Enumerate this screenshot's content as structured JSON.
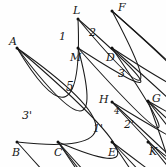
{
  "diagram": {
    "stroke_color": "#1a1a1a",
    "background_color": "#fefefe",
    "vertex_labels": [
      {
        "name": "A",
        "text": "A",
        "x": 9,
        "y": 36
      },
      {
        "name": "L",
        "text": "L",
        "x": 73,
        "y": 5
      },
      {
        "name": "F",
        "text": "F",
        "x": 118,
        "y": 2
      },
      {
        "name": "M",
        "text": "M",
        "x": 70,
        "y": 52
      },
      {
        "name": "D",
        "text": "D",
        "x": 106,
        "y": 52
      },
      {
        "name": "H",
        "text": "H",
        "x": 99,
        "y": 94
      },
      {
        "name": "G",
        "text": "G",
        "x": 152,
        "y": 93
      },
      {
        "name": "B",
        "text": "B",
        "x": 12,
        "y": 147
      },
      {
        "name": "C",
        "text": "C",
        "x": 54,
        "y": 147
      },
      {
        "name": "E",
        "text": "E",
        "x": 108,
        "y": 147
      },
      {
        "name": "K",
        "text": "K",
        "x": 149,
        "y": 146
      }
    ],
    "region_labels": [
      {
        "name": "region-1",
        "text": "1",
        "x": 59,
        "y": 31,
        "size": "region"
      },
      {
        "name": "region-2",
        "text": "2",
        "x": 89,
        "y": 27,
        "size": "region"
      },
      {
        "name": "region-3",
        "text": "3",
        "x": 118,
        "y": 68,
        "size": "region"
      },
      {
        "name": "region-5",
        "text": "5",
        "x": 66,
        "y": 81,
        "size": "region-big"
      },
      {
        "name": "region-3-prime",
        "text": "3'",
        "x": 22,
        "y": 110,
        "size": "region"
      },
      {
        "name": "region-4",
        "text": "4",
        "x": 114,
        "y": 107,
        "size": "small"
      },
      {
        "name": "region-1-prime",
        "text": "1'",
        "x": 93,
        "y": 123,
        "size": "region"
      },
      {
        "name": "region-2-prime",
        "text": "2'",
        "x": 124,
        "y": 119,
        "size": "region"
      }
    ],
    "points": {
      "A": {
        "x": 17,
        "y": 48
      },
      "L": {
        "x": 78,
        "y": 19
      },
      "F": {
        "x": 112,
        "y": 11
      },
      "M": {
        "x": 78,
        "y": 48
      },
      "D": {
        "x": 112,
        "y": 48
      },
      "H": {
        "x": 112,
        "y": 102
      },
      "G": {
        "x": 148,
        "y": 101
      },
      "B": {
        "x": 17,
        "y": 142
      },
      "C": {
        "x": 58,
        "y": 142
      },
      "E": {
        "x": 112,
        "y": 142
      },
      "K": {
        "x": 148,
        "y": 142
      }
    },
    "segments": [
      {
        "name": "segment-A-L",
        "from": "A",
        "to": "L"
      },
      {
        "name": "segment-L-F",
        "from": "L",
        "to": "F"
      },
      {
        "name": "segment-F-D",
        "from": "F",
        "to": "D"
      },
      {
        "name": "segment-F-G",
        "from": "F",
        "to": "G"
      },
      {
        "name": "segment-A-M",
        "from": "A",
        "to": "M"
      },
      {
        "name": "segment-M-D",
        "from": "M",
        "to": "D"
      },
      {
        "name": "segment-L-M",
        "from": "L",
        "to": "M"
      },
      {
        "name": "segment-D-H",
        "from": "D",
        "to": "H"
      },
      {
        "name": "segment-H-G",
        "from": "H",
        "to": "G"
      },
      {
        "name": "segment-H-E",
        "from": "H",
        "to": "E"
      },
      {
        "name": "segment-G-K",
        "from": "G",
        "to": "K"
      },
      {
        "name": "segment-A-B",
        "from": "A",
        "to": "B"
      },
      {
        "name": "segment-A-C",
        "from": "A",
        "to": "C"
      },
      {
        "name": "segment-B-C",
        "from": "B",
        "to": "C"
      },
      {
        "name": "segment-C-E",
        "from": "C",
        "to": "E"
      },
      {
        "name": "segment-E-K",
        "from": "E",
        "to": "K"
      },
      {
        "name": "segment-C-G",
        "from": "C",
        "to": "G"
      }
    ],
    "vertex_dots": [
      "A",
      "B",
      "C",
      "E",
      "K",
      "G",
      "H",
      "D",
      "M",
      "L",
      "F"
    ]
  }
}
